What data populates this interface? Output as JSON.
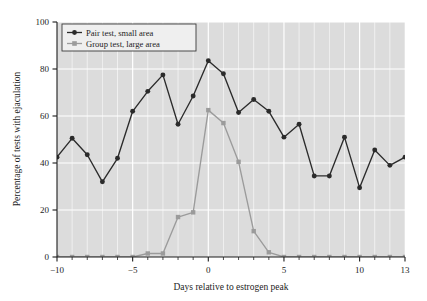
{
  "chart_data": {
    "type": "line",
    "title": "",
    "xlabel": "Days relative to estrogen peak",
    "ylabel": "Percentage of tests with ejaculation",
    "x": [
      -10,
      -9,
      -8,
      -7,
      -6,
      -5,
      -4,
      -3,
      -2,
      -1,
      0,
      1,
      2,
      3,
      4,
      5,
      6,
      7,
      8,
      9,
      10,
      11,
      12,
      13
    ],
    "xlim": [
      -10,
      13
    ],
    "ylim": [
      0,
      100
    ],
    "xticks": [
      -10,
      -5,
      0,
      5,
      10,
      13
    ],
    "xtick_labels": [
      "−10",
      "−5",
      "0",
      "5",
      "10",
      "13"
    ],
    "yticks": [
      0,
      20,
      40,
      60,
      80,
      100
    ],
    "ytick_labels": [
      "0",
      "20",
      "40",
      "60",
      "80",
      "100"
    ],
    "grid": true,
    "grid_color": "#ffffff",
    "plot_background": "#dcdcdc",
    "legend_position": "upper-left",
    "series": [
      {
        "name": "Pair test, small area",
        "color": "#2b2b2b",
        "marker": "circle",
        "values": [
          42.5,
          50.5,
          43.5,
          32.0,
          42.0,
          62.0,
          70.5,
          77.5,
          56.5,
          68.5,
          83.5,
          78.0,
          61.5,
          67.0,
          62.0,
          51.0,
          56.5,
          34.5,
          34.5,
          51.0,
          29.5,
          45.5,
          39.0,
          42.5
        ]
      },
      {
        "name": "Group test, large area",
        "color": "#9b9b9b",
        "marker": "square",
        "values": [
          0.0,
          0.0,
          0.0,
          0.0,
          0.0,
          0.0,
          1.5,
          1.5,
          17.0,
          19.0,
          62.5,
          57.0,
          40.5,
          11.0,
          2.0,
          0.0,
          0.0,
          0.0,
          0.0,
          0.0,
          0.0,
          0.0,
          0.0,
          0.0
        ]
      }
    ]
  },
  "legend": {
    "entries": [
      {
        "label": "Pair test, small area"
      },
      {
        "label": "Group test, large area"
      }
    ]
  },
  "axes": {
    "x_title": "Days relative to estrogen peak",
    "y_title": "Percentage of tests with ejaculation"
  }
}
